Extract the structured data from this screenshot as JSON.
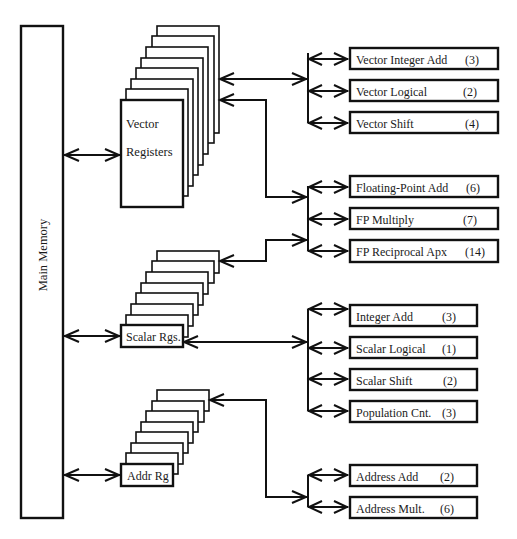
{
  "diagram": {
    "main_memory": {
      "label": "Main Memory"
    },
    "register_files": [
      {
        "id": "vector",
        "label_line1": "Vector",
        "label_line2": "Registers",
        "pages": 8
      },
      {
        "id": "scalar",
        "label": "Scalar Rgs.",
        "pages": 8
      },
      {
        "id": "address",
        "label": "Addr Rg",
        "pages": 8
      }
    ],
    "unit_groups": [
      {
        "id": "vector-units",
        "source": "vector",
        "units": [
          {
            "name": "Vector Integer Add",
            "latency": "(3)"
          },
          {
            "name": "Vector Logical",
            "latency": "(2)"
          },
          {
            "name": "Vector Shift",
            "latency": "(4)"
          }
        ]
      },
      {
        "id": "fp-units",
        "source": "vector+scalar",
        "units": [
          {
            "name": "Floating-Point Add",
            "latency": "(6)"
          },
          {
            "name": "FP Multiply",
            "latency": "(7)"
          },
          {
            "name": "FP Reciprocal Apx",
            "latency": "(14)"
          }
        ]
      },
      {
        "id": "scalar-units",
        "source": "scalar",
        "units": [
          {
            "name": "Integer Add",
            "latency": "(3)"
          },
          {
            "name": "Scalar Logical",
            "latency": "(1)"
          },
          {
            "name": "Scalar Shift",
            "latency": "(2)"
          },
          {
            "name": "Population Cnt.",
            "latency": "(3)"
          }
        ]
      },
      {
        "id": "address-units",
        "source": "address",
        "units": [
          {
            "name": "Address Add",
            "latency": "(2)"
          },
          {
            "name": "Address Mult.",
            "latency": "(6)"
          }
        ]
      }
    ],
    "colors": {
      "stroke": "#111111",
      "background": "#ffffff",
      "text": "#1a1a1a"
    }
  }
}
